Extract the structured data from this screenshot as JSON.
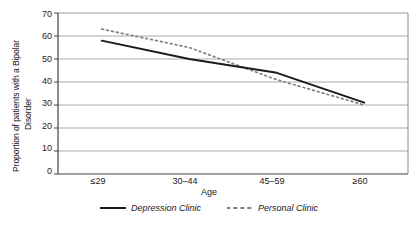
{
  "chart_data": {
    "type": "line",
    "title": "",
    "xlabel": "Age",
    "ylabel_line1": "Proportion of patients with a Bipolar",
    "ylabel_line2": "Disorder",
    "categories": [
      "≤29",
      "30–44",
      "45–59",
      "≥60"
    ],
    "yticks": [
      "0",
      "10",
      "20",
      "30",
      "40",
      "50",
      "60",
      "70"
    ],
    "ylim": [
      0,
      70
    ],
    "grid": "horizontal",
    "legend_position": "bottom-center",
    "series": [
      {
        "name": "Depression Clinic",
        "style": "solid",
        "color": "#1a1a1a",
        "values": [
          58,
          50,
          44,
          31
        ]
      },
      {
        "name": "Personal Clinic",
        "style": "dotted",
        "color": "#808080",
        "values": [
          63,
          55,
          41,
          30
        ]
      }
    ]
  },
  "legend": {
    "entries": [
      {
        "label": "Depression Clinic"
      },
      {
        "label": "Personal Clinic"
      }
    ]
  },
  "colors": {
    "depression_clinic": "#1a1a1a",
    "personal_clinic": "#808080",
    "gridline": "#aaaaaa",
    "axis": "#555555",
    "background": "#ffffff"
  }
}
